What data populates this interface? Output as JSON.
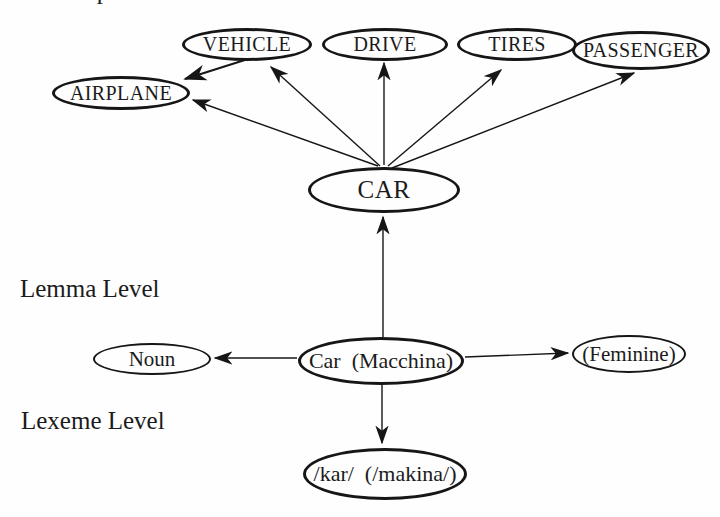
{
  "page": {
    "background": "#fefefe",
    "ink": "#161616"
  },
  "labels": {
    "conceptual_partial": "Conceptual Level",
    "lemma": "Lemma Level",
    "lexeme": "Lexeme Level"
  },
  "nodes": {
    "airplane": {
      "label": "AIRPLANE"
    },
    "vehicle": {
      "label": "VEHICLE"
    },
    "drive": {
      "label": "DRIVE"
    },
    "tires": {
      "label": "TIRES"
    },
    "passenger": {
      "label": "PASSENGER"
    },
    "car": {
      "label": "CAR"
    },
    "noun": {
      "label": "Noun"
    },
    "car_macchina": {
      "label": "Car  (Macchina)"
    },
    "feminine": {
      "label": "(Feminine)"
    },
    "kar": {
      "label": "/kar/  (/makina/)"
    }
  },
  "edges": [
    {
      "from": "car",
      "to": "airplane",
      "style": "thin-arrow"
    },
    {
      "from": "car",
      "to": "vehicle",
      "style": "thin-arrow"
    },
    {
      "from": "car",
      "to": "drive",
      "style": "thin-arrow"
    },
    {
      "from": "car",
      "to": "tires",
      "style": "thin-arrow"
    },
    {
      "from": "car",
      "to": "passenger",
      "style": "thin-arrow"
    },
    {
      "from": "vehicle",
      "to": "airplane",
      "style": "thick-arrow"
    },
    {
      "from": "car_macchina",
      "to": "car",
      "style": "thin-arrow"
    },
    {
      "from": "car_macchina",
      "to": "noun",
      "style": "thin-arrow"
    },
    {
      "from": "car_macchina",
      "to": "feminine",
      "style": "thin-arrow"
    },
    {
      "from": "car_macchina",
      "to": "kar",
      "style": "thin-arrow"
    }
  ]
}
